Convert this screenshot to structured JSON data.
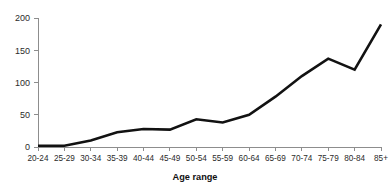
{
  "chart_data": {
    "type": "line",
    "title": "",
    "subtitle": "",
    "xlabel": "Age range",
    "ylabel": "",
    "categories": [
      "20-24",
      "25-29",
      "30-34",
      "35-39",
      "40-44",
      "45-49",
      "50-54",
      "55-59",
      "60-64",
      "65-69",
      "70-74",
      "75-79",
      "80-84",
      "85+"
    ],
    "values": [
      2,
      2,
      10,
      23,
      28,
      27,
      43,
      38,
      50,
      78,
      110,
      137,
      120,
      190
    ],
    "series": [
      {
        "name": "count",
        "values": [
          2,
          2,
          10,
          23,
          28,
          27,
          43,
          38,
          50,
          78,
          110,
          137,
          120,
          190
        ]
      }
    ],
    "ylim": [
      0,
      200
    ],
    "yticks": [
      0,
      50,
      100,
      150,
      200
    ],
    "ytick_labels": [
      "0",
      "50",
      "100",
      "150",
      "200"
    ],
    "xtick_labels": [
      "20-24",
      "25-29",
      "30-34",
      "35-39",
      "40-44",
      "45-49",
      "50-54",
      "55-59",
      "60-64",
      "65-69",
      "70-74",
      "75-79",
      "80-84",
      "85+"
    ],
    "grid": false,
    "legend": null,
    "legend_position": "none",
    "annotations": [],
    "colors": {
      "line": "#121212",
      "axis": "#8d8d8d",
      "text": "#2b2b2b",
      "background": "#ffffff"
    }
  }
}
